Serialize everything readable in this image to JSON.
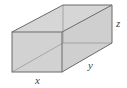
{
  "diagram": {
    "type": "rectangular-box",
    "labels": {
      "x": "x",
      "y": "y",
      "z": "z"
    },
    "colors": {
      "face_fill": "#d0d0d0",
      "edge": "#6a6a6a",
      "hidden_edge": "#9a9a9a",
      "label": "#444444"
    }
  }
}
